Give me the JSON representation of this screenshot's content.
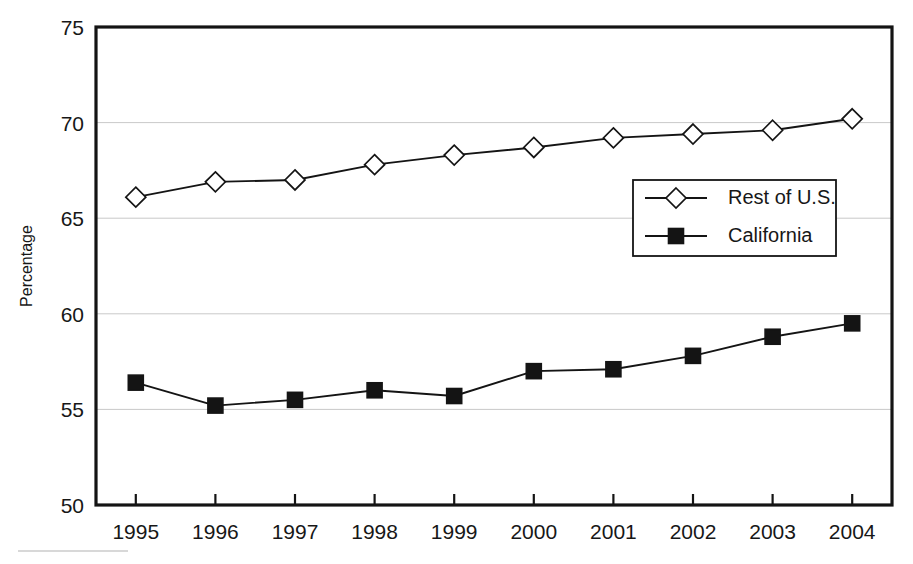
{
  "chart_data": {
    "type": "line",
    "title": "",
    "xlabel": "",
    "ylabel": "Percentage",
    "categories": [
      "1995",
      "1996",
      "1997",
      "1998",
      "1999",
      "2000",
      "2001",
      "2002",
      "2003",
      "2004"
    ],
    "x": [
      1995,
      1996,
      1997,
      1998,
      1999,
      2000,
      2001,
      2002,
      2003,
      2004
    ],
    "series": [
      {
        "name": "Rest of U.S.",
        "marker": "open-diamond",
        "color": "#141414",
        "values": [
          66.1,
          66.9,
          67.0,
          67.8,
          68.3,
          68.7,
          69.2,
          69.4,
          69.6,
          70.2
        ]
      },
      {
        "name": "California",
        "marker": "filled-square",
        "color": "#141414",
        "values": [
          56.4,
          55.2,
          55.5,
          56.0,
          55.7,
          57.0,
          57.1,
          57.8,
          58.8,
          59.5
        ]
      }
    ],
    "ylim": [
      50,
      75
    ],
    "yticks": [
      50,
      55,
      60,
      65,
      70,
      75
    ],
    "ytick_labels": [
      "50",
      "55",
      "60",
      "65",
      "70",
      "75"
    ],
    "grid": true,
    "grid_axis": "y",
    "legend_position": "center-right"
  },
  "axes": {
    "y_title": "Percentage",
    "y_tick_labels": [
      "75",
      "70",
      "65",
      "60",
      "55",
      "50"
    ],
    "x_tick_labels": [
      "1995",
      "1996",
      "1997",
      "1998",
      "1999",
      "2000",
      "2001",
      "2002",
      "2003",
      "2004"
    ]
  },
  "legend": {
    "entries": [
      {
        "label": "Rest of U.S."
      },
      {
        "label": "California"
      }
    ]
  },
  "colors": {
    "ink": "#141414",
    "grid": "#c9c9c9",
    "background": "#ffffff"
  }
}
